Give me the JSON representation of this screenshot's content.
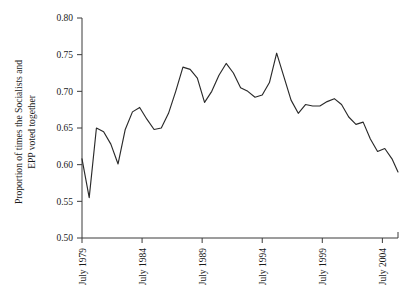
{
  "chart_data": {
    "type": "line",
    "title": "",
    "xlabel": "",
    "ylabel_line1": "Proportion of times the Socialists and",
    "ylabel_line2": "EPP voted together",
    "ylim": [
      0.5,
      0.8
    ],
    "ytick_labels": [
      "0.80",
      "0.75",
      "0.70",
      "0.65",
      "0.60",
      "0.55",
      "0.50"
    ],
    "ytick_values": [
      0.8,
      0.75,
      0.7,
      0.65,
      0.6,
      0.55,
      0.5
    ],
    "xtick_labels": [
      "July 1979",
      "July 1984",
      "July 1989",
      "July 1994",
      "July 1999",
      "July 2004"
    ],
    "xtick_values": [
      1979.5,
      1984.5,
      1989.5,
      1994.5,
      1999.5,
      2004.5
    ],
    "xlim": [
      1979.5,
      2005.8
    ],
    "grid": false,
    "legend": null,
    "series": [
      {
        "name": "Socialists and EPP voted together",
        "line_color": "#2a2a2a",
        "x": [
          1979.5,
          1980.1,
          1980.7,
          1981.3,
          1981.9,
          1982.5,
          1983.1,
          1983.7,
          1984.3,
          1984.9,
          1985.5,
          1986.1,
          1986.7,
          1987.3,
          1987.9,
          1988.5,
          1989.1,
          1989.7,
          1990.3,
          1990.9,
          1991.5,
          1992.1,
          1992.7,
          1993.3,
          1993.9,
          1994.5,
          1995.1,
          1995.7,
          1996.3,
          1996.9,
          1997.5,
          1998.1,
          1998.7,
          1999.3,
          1999.9,
          2000.5,
          2001.1,
          2001.7,
          2002.3,
          2002.9,
          2003.5,
          2004.1,
          2004.7,
          2005.3,
          2005.8
        ],
        "y": [
          0.608,
          0.555,
          0.65,
          0.645,
          0.628,
          0.601,
          0.648,
          0.672,
          0.678,
          0.662,
          0.648,
          0.65,
          0.67,
          0.7,
          0.733,
          0.73,
          0.718,
          0.685,
          0.7,
          0.722,
          0.738,
          0.725,
          0.705,
          0.7,
          0.692,
          0.695,
          0.712,
          0.752,
          0.72,
          0.688,
          0.67,
          0.682,
          0.68,
          0.68,
          0.686,
          0.69,
          0.682,
          0.665,
          0.655,
          0.658,
          0.635,
          0.618,
          0.622,
          0.608,
          0.59
        ]
      }
    ]
  }
}
